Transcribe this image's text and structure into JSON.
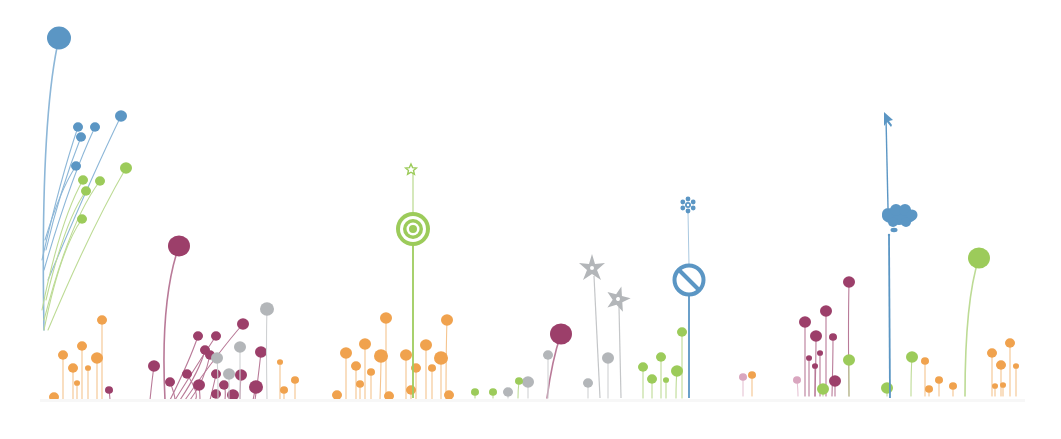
{
  "illustration": {
    "description": "Decorative meadow of stylized flower stems with icon-shaped blooms",
    "background": "#ffffff",
    "colors": {
      "blue": "#5b96c4",
      "green": "#9ccb5a",
      "plum": "#9c3f6a",
      "orange": "#f0a24e",
      "gray": "#b3b6b9",
      "pink": "#d9a6bf"
    },
    "feature_icons": [
      {
        "name": "star-icon",
        "x": 411,
        "y": 169,
        "color": "#9ccb5a"
      },
      {
        "name": "target-icon",
        "x": 413,
        "y": 229,
        "color": "#9ccb5a"
      },
      {
        "name": "snowflake-icon",
        "x": 688,
        "y": 205,
        "color": "#5b96c4"
      },
      {
        "name": "no-entry-icon",
        "x": 689,
        "y": 280,
        "color": "#5b96c4"
      },
      {
        "name": "cursor-arrow-icon",
        "x": 886,
        "y": 118,
        "color": "#5b96c4"
      },
      {
        "name": "thought-cloud-icon",
        "x": 899,
        "y": 216,
        "color": "#5b96c4"
      },
      {
        "name": "pinwheel-flower-icon",
        "x": 592,
        "y": 268,
        "color": "#b3b6b9"
      },
      {
        "name": "pinwheel-flower-icon",
        "x": 618,
        "y": 299,
        "color": "#b3b6b9"
      }
    ],
    "stems": [
      {
        "x0": 44,
        "y0": 330,
        "cx": 40,
        "cy": 120,
        "x1": 59,
        "y1": 38,
        "r": 12,
        "c": "blue"
      },
      {
        "x0": 42,
        "y0": 260,
        "cx": 60,
        "cy": 180,
        "x1": 78,
        "y1": 127,
        "r": 5,
        "c": "blue"
      },
      {
        "x0": 44,
        "y0": 270,
        "cx": 70,
        "cy": 180,
        "x1": 95,
        "y1": 127,
        "r": 5,
        "c": "blue"
      },
      {
        "x0": 46,
        "y0": 250,
        "cx": 60,
        "cy": 190,
        "x1": 81,
        "y1": 137,
        "r": 5,
        "c": "blue"
      },
      {
        "x0": 48,
        "y0": 280,
        "cx": 90,
        "cy": 180,
        "x1": 121,
        "y1": 116,
        "r": 6,
        "c": "blue"
      },
      {
        "x0": 45,
        "y0": 240,
        "cx": 60,
        "cy": 190,
        "x1": 76,
        "y1": 166,
        "r": 5,
        "c": "blue"
      },
      {
        "x0": 42,
        "y0": 310,
        "cx": 60,
        "cy": 220,
        "x1": 83,
        "y1": 180,
        "r": 5,
        "c": "green"
      },
      {
        "x0": 44,
        "y0": 320,
        "cx": 70,
        "cy": 220,
        "x1": 100,
        "y1": 181,
        "r": 5,
        "c": "green"
      },
      {
        "x0": 46,
        "y0": 300,
        "cx": 65,
        "cy": 220,
        "x1": 86,
        "y1": 191,
        "r": 5,
        "c": "green"
      },
      {
        "x0": 48,
        "y0": 330,
        "cx": 90,
        "cy": 230,
        "x1": 126,
        "y1": 168,
        "r": 6,
        "c": "green"
      },
      {
        "x0": 44,
        "y0": 330,
        "cx": 60,
        "cy": 250,
        "x1": 82,
        "y1": 219,
        "r": 5,
        "c": "green"
      },
      {
        "x0": 165,
        "y0": 400,
        "cx": 160,
        "cy": 300,
        "x1": 179,
        "y1": 246,
        "r": 11,
        "c": "plum"
      },
      {
        "x0": 150,
        "y0": 400,
        "cx": 152,
        "cy": 380,
        "x1": 154,
        "y1": 366,
        "r": 6,
        "c": "plum"
      },
      {
        "x0": 170,
        "y0": 400,
        "cx": 190,
        "cy": 360,
        "x1": 198,
        "y1": 336,
        "r": 5,
        "c": "plum"
      },
      {
        "x0": 175,
        "y0": 400,
        "cx": 200,
        "cy": 360,
        "x1": 216,
        "y1": 336,
        "r": 5,
        "c": "plum"
      },
      {
        "x0": 180,
        "y0": 400,
        "cx": 200,
        "cy": 370,
        "x1": 205,
        "y1": 350,
        "r": 5,
        "c": "plum"
      },
      {
        "x0": 185,
        "y0": 400,
        "cx": 220,
        "cy": 350,
        "x1": 243,
        "y1": 324,
        "r": 6,
        "c": "plum"
      },
      {
        "x0": 190,
        "y0": 400,
        "cx": 205,
        "cy": 380,
        "x1": 210,
        "y1": 355,
        "r": 5,
        "c": "plum"
      },
      {
        "x0": 195,
        "y0": 400,
        "cx": 200,
        "cy": 395,
        "x1": 187,
        "y1": 374,
        "r": 5,
        "c": "plum"
      },
      {
        "x0": 200,
        "y0": 400,
        "cx": 200,
        "cy": 395,
        "x1": 199,
        "y1": 385,
        "r": 6,
        "c": "plum"
      },
      {
        "x0": 175,
        "y0": 400,
        "cx": 175,
        "cy": 395,
        "x1": 170,
        "y1": 382,
        "r": 5,
        "c": "plum"
      },
      {
        "x0": 210,
        "y0": 400,
        "cx": 215,
        "cy": 380,
        "x1": 216,
        "y1": 374,
        "r": 5,
        "c": "plum"
      },
      {
        "x0": 225,
        "y0": 400,
        "cx": 226,
        "cy": 390,
        "x1": 224,
        "y1": 385,
        "r": 5,
        "c": "plum"
      },
      {
        "x0": 240,
        "y0": 400,
        "cx": 240,
        "cy": 390,
        "x1": 241,
        "y1": 375,
        "r": 6,
        "c": "plum"
      },
      {
        "x0": 255,
        "y0": 400,
        "cx": 258,
        "cy": 380,
        "x1": 261,
        "y1": 352,
        "r": 6,
        "c": "plum"
      },
      {
        "x0": 253,
        "y0": 400,
        "cx": 254,
        "cy": 395,
        "x1": 256,
        "y1": 387,
        "r": 7,
        "c": "plum"
      },
      {
        "x0": 232,
        "y0": 400,
        "cx": 233,
        "cy": 398,
        "x1": 233,
        "y1": 395,
        "r": 6,
        "c": "plum"
      },
      {
        "x0": 218,
        "y0": 400,
        "cx": 218,
        "cy": 398,
        "x1": 216,
        "y1": 394,
        "r": 5,
        "c": "plum"
      },
      {
        "x0": 110,
        "y0": 400,
        "cx": 110,
        "cy": 398,
        "x1": 109,
        "y1": 390,
        "r": 4,
        "c": "plum"
      },
      {
        "x0": 267,
        "y0": 400,
        "cx": 266,
        "cy": 340,
        "x1": 267,
        "y1": 309,
        "r": 7,
        "c": "gray"
      },
      {
        "x0": 240,
        "y0": 400,
        "cx": 240,
        "cy": 370,
        "x1": 240,
        "y1": 347,
        "r": 6,
        "c": "gray"
      },
      {
        "x0": 218,
        "y0": 400,
        "cx": 218,
        "cy": 370,
        "x1": 217,
        "y1": 358,
        "r": 6,
        "c": "gray"
      },
      {
        "x0": 229,
        "y0": 400,
        "cx": 229,
        "cy": 385,
        "x1": 229,
        "y1": 374,
        "r": 6,
        "c": "gray"
      },
      {
        "x0": 102,
        "y0": 400,
        "cx": 102,
        "cy": 350,
        "x1": 102,
        "y1": 320,
        "r": 5,
        "c": "orange"
      },
      {
        "x0": 82,
        "y0": 400,
        "cx": 82,
        "cy": 370,
        "x1": 82,
        "y1": 346,
        "r": 5,
        "c": "orange"
      },
      {
        "x0": 63,
        "y0": 400,
        "cx": 63,
        "cy": 375,
        "x1": 63,
        "y1": 355,
        "r": 5,
        "c": "orange"
      },
      {
        "x0": 97,
        "y0": 400,
        "cx": 97,
        "cy": 375,
        "x1": 97,
        "y1": 358,
        "r": 6,
        "c": "orange"
      },
      {
        "x0": 73,
        "y0": 400,
        "cx": 73,
        "cy": 380,
        "x1": 73,
        "y1": 368,
        "r": 5,
        "c": "orange"
      },
      {
        "x0": 88,
        "y0": 400,
        "cx": 88,
        "cy": 385,
        "x1": 88,
        "y1": 368,
        "r": 3,
        "c": "orange"
      },
      {
        "x0": 54,
        "y0": 400,
        "cx": 54,
        "cy": 398,
        "x1": 54,
        "y1": 397,
        "r": 5,
        "c": "orange"
      },
      {
        "x0": 77,
        "y0": 400,
        "cx": 77,
        "cy": 390,
        "x1": 77,
        "y1": 383,
        "r": 3,
        "c": "orange"
      },
      {
        "x0": 280,
        "y0": 400,
        "cx": 280,
        "cy": 380,
        "x1": 280,
        "y1": 362,
        "r": 3,
        "c": "orange"
      },
      {
        "x0": 295,
        "y0": 400,
        "cx": 295,
        "cy": 390,
        "x1": 295,
        "y1": 380,
        "r": 4,
        "c": "orange"
      },
      {
        "x0": 284,
        "y0": 400,
        "cx": 284,
        "cy": 395,
        "x1": 284,
        "y1": 390,
        "r": 4,
        "c": "orange"
      },
      {
        "x0": 386,
        "y0": 400,
        "cx": 386,
        "cy": 350,
        "x1": 386,
        "y1": 318,
        "r": 6,
        "c": "orange"
      },
      {
        "x0": 446,
        "y0": 400,
        "cx": 446,
        "cy": 350,
        "x1": 447,
        "y1": 320,
        "r": 6,
        "c": "orange"
      },
      {
        "x0": 365,
        "y0": 400,
        "cx": 365,
        "cy": 370,
        "x1": 365,
        "y1": 344,
        "r": 6,
        "c": "orange"
      },
      {
        "x0": 346,
        "y0": 400,
        "cx": 346,
        "cy": 370,
        "x1": 346,
        "y1": 353,
        "r": 6,
        "c": "orange"
      },
      {
        "x0": 380,
        "y0": 400,
        "cx": 381,
        "cy": 370,
        "x1": 381,
        "y1": 356,
        "r": 7,
        "c": "orange"
      },
      {
        "x0": 406,
        "y0": 400,
        "cx": 406,
        "cy": 370,
        "x1": 406,
        "y1": 355,
        "r": 6,
        "c": "orange"
      },
      {
        "x0": 426,
        "y0": 400,
        "cx": 426,
        "cy": 370,
        "x1": 426,
        "y1": 345,
        "r": 6,
        "c": "orange"
      },
      {
        "x0": 441,
        "y0": 400,
        "cx": 441,
        "cy": 375,
        "x1": 441,
        "y1": 358,
        "r": 7,
        "c": "orange"
      },
      {
        "x0": 356,
        "y0": 400,
        "cx": 356,
        "cy": 380,
        "x1": 356,
        "y1": 366,
        "r": 5,
        "c": "orange"
      },
      {
        "x0": 371,
        "y0": 400,
        "cx": 371,
        "cy": 385,
        "x1": 371,
        "y1": 372,
        "r": 4,
        "c": "orange"
      },
      {
        "x0": 416,
        "y0": 400,
        "cx": 416,
        "cy": 385,
        "x1": 416,
        "y1": 368,
        "r": 5,
        "c": "orange"
      },
      {
        "x0": 432,
        "y0": 400,
        "cx": 432,
        "cy": 385,
        "x1": 432,
        "y1": 368,
        "r": 4,
        "c": "orange"
      },
      {
        "x0": 360,
        "y0": 400,
        "cx": 360,
        "cy": 395,
        "x1": 360,
        "y1": 384,
        "r": 4,
        "c": "orange"
      },
      {
        "x0": 411,
        "y0": 400,
        "cx": 411,
        "cy": 395,
        "x1": 411,
        "y1": 390,
        "r": 5,
        "c": "orange"
      },
      {
        "x0": 337,
        "y0": 400,
        "cx": 337,
        "cy": 398,
        "x1": 337,
        "y1": 395,
        "r": 5,
        "c": "orange"
      },
      {
        "x0": 449,
        "y0": 400,
        "cx": 449,
        "cy": 398,
        "x1": 449,
        "y1": 395,
        "r": 5,
        "c": "orange"
      },
      {
        "x0": 389,
        "y0": 400,
        "cx": 389,
        "cy": 398,
        "x1": 389,
        "y1": 396,
        "r": 5,
        "c": "orange"
      },
      {
        "x0": 547,
        "y0": 398,
        "cx": 552,
        "cy": 360,
        "x1": 561,
        "y1": 334,
        "r": 11,
        "c": "plum"
      },
      {
        "x0": 548,
        "y0": 398,
        "cx": 548,
        "cy": 370,
        "x1": 548,
        "y1": 355,
        "r": 5,
        "c": "gray"
      },
      {
        "x0": 528,
        "y0": 398,
        "cx": 528,
        "cy": 390,
        "x1": 528,
        "y1": 382,
        "r": 6,
        "c": "gray"
      },
      {
        "x0": 588,
        "y0": 398,
        "cx": 588,
        "cy": 390,
        "x1": 588,
        "y1": 383,
        "r": 5,
        "c": "gray"
      },
      {
        "x0": 608,
        "y0": 398,
        "cx": 608,
        "cy": 370,
        "x1": 608,
        "y1": 358,
        "r": 6,
        "c": "gray"
      },
      {
        "x0": 508,
        "y0": 398,
        "cx": 508,
        "cy": 395,
        "x1": 508,
        "y1": 392,
        "r": 5,
        "c": "gray"
      },
      {
        "x0": 475,
        "y0": 398,
        "cx": 475,
        "cy": 395,
        "x1": 475,
        "y1": 392,
        "r": 4,
        "c": "green"
      },
      {
        "x0": 493,
        "y0": 398,
        "cx": 493,
        "cy": 395,
        "x1": 493,
        "y1": 392,
        "r": 4,
        "c": "green"
      },
      {
        "x0": 518,
        "y0": 398,
        "cx": 518,
        "cy": 390,
        "x1": 519,
        "y1": 381,
        "r": 4,
        "c": "green"
      },
      {
        "x0": 682,
        "y0": 398,
        "cx": 682,
        "cy": 360,
        "x1": 682,
        "y1": 332,
        "r": 5,
        "c": "green"
      },
      {
        "x0": 661,
        "y0": 398,
        "cx": 661,
        "cy": 370,
        "x1": 661,
        "y1": 357,
        "r": 5,
        "c": "green"
      },
      {
        "x0": 643,
        "y0": 398,
        "cx": 643,
        "cy": 380,
        "x1": 643,
        "y1": 367,
        "r": 5,
        "c": "green"
      },
      {
        "x0": 676,
        "y0": 398,
        "cx": 676,
        "cy": 380,
        "x1": 677,
        "y1": 371,
        "r": 6,
        "c": "green"
      },
      {
        "x0": 652,
        "y0": 398,
        "cx": 652,
        "cy": 390,
        "x1": 652,
        "y1": 379,
        "r": 5,
        "c": "green"
      },
      {
        "x0": 666,
        "y0": 398,
        "cx": 666,
        "cy": 390,
        "x1": 666,
        "y1": 380,
        "r": 3,
        "c": "green"
      },
      {
        "x0": 849,
        "y0": 396,
        "cx": 848,
        "cy": 330,
        "x1": 849,
        "y1": 282,
        "r": 6,
        "c": "plum"
      },
      {
        "x0": 805,
        "y0": 396,
        "cx": 805,
        "cy": 350,
        "x1": 805,
        "y1": 322,
        "r": 6,
        "c": "plum"
      },
      {
        "x0": 826,
        "y0": 396,
        "cx": 826,
        "cy": 345,
        "x1": 826,
        "y1": 311,
        "r": 6,
        "c": "plum"
      },
      {
        "x0": 815,
        "y0": 396,
        "cx": 816,
        "cy": 360,
        "x1": 816,
        "y1": 336,
        "r": 6,
        "c": "plum"
      },
      {
        "x0": 832,
        "y0": 396,
        "cx": 833,
        "cy": 360,
        "x1": 833,
        "y1": 337,
        "r": 4,
        "c": "plum"
      },
      {
        "x0": 809,
        "y0": 396,
        "cx": 809,
        "cy": 370,
        "x1": 809,
        "y1": 358,
        "r": 3,
        "c": "plum"
      },
      {
        "x0": 820,
        "y0": 396,
        "cx": 820,
        "cy": 370,
        "x1": 820,
        "y1": 353,
        "r": 3,
        "c": "plum"
      },
      {
        "x0": 815,
        "y0": 396,
        "cx": 815,
        "cy": 375,
        "x1": 815,
        "y1": 366,
        "r": 3,
        "c": "plum"
      },
      {
        "x0": 835,
        "y0": 396,
        "cx": 835,
        "cy": 390,
        "x1": 835,
        "y1": 381,
        "r": 6,
        "c": "plum"
      },
      {
        "x0": 849,
        "y0": 396,
        "cx": 849,
        "cy": 370,
        "x1": 849,
        "y1": 360,
        "r": 6,
        "c": "green"
      },
      {
        "x0": 823,
        "y0": 396,
        "cx": 823,
        "cy": 392,
        "x1": 823,
        "y1": 389,
        "r": 6,
        "c": "green"
      },
      {
        "x0": 887,
        "y0": 396,
        "cx": 887,
        "cy": 392,
        "x1": 887,
        "y1": 388,
        "r": 6,
        "c": "green"
      },
      {
        "x0": 911,
        "y0": 396,
        "cx": 911,
        "cy": 370,
        "x1": 912,
        "y1": 357,
        "r": 6,
        "c": "green"
      },
      {
        "x0": 798,
        "y0": 396,
        "cx": 798,
        "cy": 390,
        "x1": 797,
        "y1": 380,
        "r": 4,
        "c": "pink"
      },
      {
        "x0": 743,
        "y0": 396,
        "cx": 743,
        "cy": 385,
        "x1": 743,
        "y1": 377,
        "r": 4,
        "c": "pink"
      },
      {
        "x0": 752,
        "y0": 396,
        "cx": 752,
        "cy": 385,
        "x1": 752,
        "y1": 375,
        "r": 4,
        "c": "orange"
      },
      {
        "x0": 965,
        "y0": 396,
        "cx": 965,
        "cy": 300,
        "x1": 979,
        "y1": 258,
        "r": 11,
        "c": "green"
      },
      {
        "x0": 1010,
        "y0": 396,
        "cx": 1010,
        "cy": 370,
        "x1": 1010,
        "y1": 343,
        "r": 5,
        "c": "orange"
      },
      {
        "x0": 992,
        "y0": 396,
        "cx": 992,
        "cy": 370,
        "x1": 992,
        "y1": 353,
        "r": 5,
        "c": "orange"
      },
      {
        "x0": 1001,
        "y0": 396,
        "cx": 1001,
        "cy": 375,
        "x1": 1001,
        "y1": 365,
        "r": 5,
        "c": "orange"
      },
      {
        "x0": 925,
        "y0": 396,
        "cx": 925,
        "cy": 375,
        "x1": 925,
        "y1": 361,
        "r": 4,
        "c": "orange"
      },
      {
        "x0": 939,
        "y0": 396,
        "cx": 939,
        "cy": 385,
        "x1": 939,
        "y1": 380,
        "r": 4,
        "c": "orange"
      },
      {
        "x0": 953,
        "y0": 396,
        "cx": 953,
        "cy": 390,
        "x1": 953,
        "y1": 386,
        "r": 4,
        "c": "orange"
      },
      {
        "x0": 929,
        "y0": 396,
        "cx": 929,
        "cy": 392,
        "x1": 929,
        "y1": 389,
        "r": 4,
        "c": "orange"
      },
      {
        "x0": 1016,
        "y0": 396,
        "cx": 1016,
        "cy": 385,
        "x1": 1016,
        "y1": 366,
        "r": 3,
        "c": "orange"
      },
      {
        "x0": 995,
        "y0": 396,
        "cx": 995,
        "cy": 390,
        "x1": 995,
        "y1": 386,
        "r": 3,
        "c": "orange"
      },
      {
        "x0": 1003,
        "y0": 396,
        "cx": 1003,
        "cy": 390,
        "x1": 1003,
        "y1": 385,
        "r": 3,
        "c": "orange"
      }
    ]
  }
}
